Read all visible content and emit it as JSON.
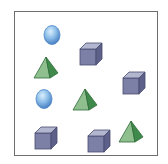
{
  "figure": {
    "colors": {
      "sphere_light": "#dceefc",
      "sphere_mid": "#8bbde8",
      "sphere_dark": "#4f86c6",
      "cube_front": "#7d80a6",
      "cube_top": "#b3b6cf",
      "cube_side": "#5d6088",
      "cube_edge": "#4a4d70",
      "pyramid_front": "#8fbf8f",
      "pyramid_side": "#3f8a4a",
      "pyramid_edge": "#2f6b38",
      "border": "#6e6e6e"
    },
    "counts": {
      "spheres": 2,
      "cubes": 4,
      "pyramids": 3
    },
    "shapes": [
      {
        "type": "sphere",
        "label": "sphere-1"
      },
      {
        "type": "cube",
        "label": "cube-1"
      },
      {
        "type": "pyramid",
        "label": "pyramid-1"
      },
      {
        "type": "cube",
        "label": "cube-2"
      },
      {
        "type": "sphere",
        "label": "sphere-2"
      },
      {
        "type": "pyramid",
        "label": "pyramid-2"
      },
      {
        "type": "cube",
        "label": "cube-3"
      },
      {
        "type": "cube",
        "label": "cube-4"
      },
      {
        "type": "pyramid",
        "label": "pyramid-3"
      }
    ]
  }
}
